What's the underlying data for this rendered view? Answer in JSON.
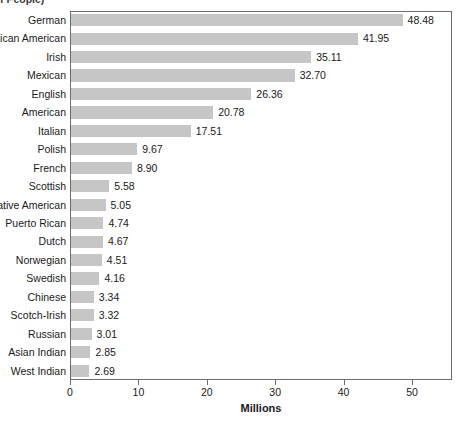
{
  "top_caption": "f People)",
  "chart_data": {
    "type": "bar",
    "orientation": "horizontal",
    "title": "",
    "subtitle": "",
    "xlabel": "Millions",
    "ylabel": "",
    "xlim": [
      0,
      55.7
    ],
    "xticks": [
      0,
      10,
      20,
      30,
      40,
      50
    ],
    "xtick_labels": [
      "0",
      "10",
      "20",
      "30",
      "40",
      "50"
    ],
    "grid": false,
    "legend": null,
    "bar_color": "#c6c6c6",
    "frame_color": "#6e6e6e",
    "text_color": "#1a1a1a",
    "categories": [
      "German",
      "African American",
      "Irish",
      "Mexican",
      "English",
      "American",
      "Italian",
      "Polish",
      "French",
      "Scottish",
      "Native American",
      "Puerto Rican",
      "Dutch",
      "Norwegian",
      "Swedish",
      "Chinese",
      "Scotch-Irish",
      "Russian",
      "Asian Indian",
      "West Indian"
    ],
    "values": [
      48.48,
      41.95,
      35.11,
      32.7,
      26.36,
      20.78,
      17.51,
      9.67,
      8.9,
      5.58,
      5.05,
      4.74,
      4.67,
      4.51,
      4.16,
      3.34,
      3.32,
      3.01,
      2.85,
      2.69
    ],
    "value_labels": [
      "48.48",
      "41.95",
      "35.11",
      "32.70",
      "26.36",
      "20.78",
      "17.51",
      "9.67",
      "8.90",
      "5.58",
      "5.05",
      "4.74",
      "4.67",
      "4.51",
      "4.16",
      "3.34",
      "3.32",
      "3.01",
      "2.85",
      "2.69"
    ]
  }
}
